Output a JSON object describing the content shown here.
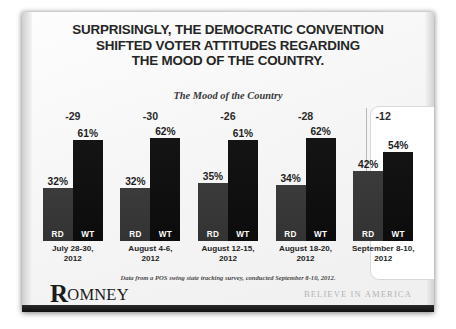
{
  "slide": {
    "title_lines": [
      "SURPRISINGLY, THE DEMOCRATIC CONVENTION",
      "SHIFTED VOTER ATTITUDES REGARDING",
      "THE MOOD OF THE COUNTRY."
    ],
    "subtitle": "The Mood of the Country",
    "footnote": "Data from a POS swing state tracking survey, conducted September 8-10, 2012.",
    "logo_initial": "R",
    "logo_rest": "OMNEY",
    "tagline": "BELIEVE IN AMERICA",
    "colors": {
      "rd_bar": "#333333",
      "wt_bar": "#0c0c0c",
      "text": "#262626",
      "tagline": "#b4b4b4",
      "footer_bar": "#111111",
      "highlight_border": "#d8d8d8"
    }
  },
  "chart_data": {
    "type": "bar",
    "title": "The Mood of the Country",
    "xlabel": "",
    "ylabel": "",
    "ylim": [
      0,
      70
    ],
    "grid": false,
    "legend": "none",
    "categories": [
      "July 28-30, 2012",
      "August 4-6, 2012",
      "August 12-15, 2012",
      "August 18-20, 2012",
      "September 8-10, 2012"
    ],
    "series": [
      {
        "name": "RD",
        "values": [
          32,
          32,
          35,
          34,
          42
        ]
      },
      {
        "name": "WT",
        "values": [
          61,
          62,
          61,
          62,
          54
        ]
      }
    ],
    "net_margins": [
      -29,
      -30,
      -26,
      -28,
      -12
    ],
    "value_suffix": "%",
    "highlighted_category_index": 4,
    "groups": [
      {
        "net": "-29",
        "date_line1": "July 28-30,",
        "date_line2": "2012",
        "bars": [
          {
            "label": "RD",
            "value": 32,
            "value_text": "32%"
          },
          {
            "label": "WT",
            "value": 61,
            "value_text": "61%"
          }
        ]
      },
      {
        "net": "-30",
        "date_line1": "August 4-6,",
        "date_line2": "2012",
        "bars": [
          {
            "label": "RD",
            "value": 32,
            "value_text": "32%"
          },
          {
            "label": "WT",
            "value": 62,
            "value_text": "62%"
          }
        ]
      },
      {
        "net": "-26",
        "date_line1": "August 12-15,",
        "date_line2": "2012",
        "bars": [
          {
            "label": "RD",
            "value": 35,
            "value_text": "35%"
          },
          {
            "label": "WT",
            "value": 61,
            "value_text": "61%"
          }
        ]
      },
      {
        "net": "-28",
        "date_line1": "August 18-20,",
        "date_line2": "2012",
        "bars": [
          {
            "label": "RD",
            "value": 34,
            "value_text": "34%"
          },
          {
            "label": "WT",
            "value": 62,
            "value_text": "62%"
          }
        ]
      },
      {
        "net": "-12",
        "date_line1": "September 8-10,",
        "date_line2": "2012",
        "bars": [
          {
            "label": "RD",
            "value": 42,
            "value_text": "42%"
          },
          {
            "label": "WT",
            "value": 54,
            "value_text": "54%"
          }
        ]
      }
    ]
  }
}
